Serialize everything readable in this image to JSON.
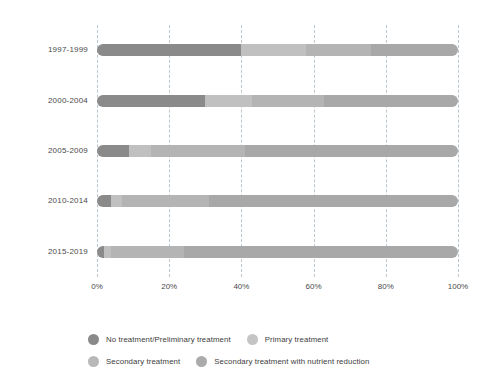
{
  "chart_data": {
    "type": "bar",
    "orientation": "horizontal",
    "stacked": true,
    "normalized": true,
    "title": "",
    "subtitle": "",
    "xlabel": "",
    "ylabel": "",
    "xlim": [
      0,
      100
    ],
    "grid": true,
    "legend_position": "bottom",
    "xtick_labels": [
      "0%",
      "20%",
      "40%",
      "60%",
      "80%",
      "100%"
    ],
    "xtick_values": [
      0,
      20,
      40,
      60,
      80,
      100
    ],
    "categories": [
      "1997-1999",
      "2000-2004",
      "2005-2009",
      "2010-2014",
      "2015-2019"
    ],
    "series": [
      {
        "name": "No treatment/Preliminary treatment",
        "color": "#8a8a8a",
        "values": [
          40,
          30,
          9,
          4,
          2
        ]
      },
      {
        "name": "Primary treatment",
        "color": "#c0c0c0",
        "values": [
          18,
          13,
          6,
          3,
          2
        ]
      },
      {
        "name": "Secondary treatment",
        "color": "#b4b4b4",
        "values": [
          18,
          20,
          26,
          24,
          20
        ]
      },
      {
        "name": "Secondary treatment with nutrient reduction",
        "color": "#a8a8a8",
        "values": [
          24,
          37,
          59,
          69,
          76
        ]
      }
    ]
  },
  "legend": {
    "items": [
      {
        "label": "No treatment/Preliminary treatment",
        "color": "#8a8a8a"
      },
      {
        "label": "Primary treatment",
        "color": "#c4c4c4"
      },
      {
        "label": "Secondary treatment",
        "color": "#b8b8b8"
      },
      {
        "label": "Secondary treatment with nutrient reduction",
        "color": "#ababab"
      }
    ]
  },
  "axis": {
    "x_ticks": [
      "0%",
      "20%",
      "40%",
      "60%",
      "80%",
      "100%"
    ],
    "y_categories": [
      "1997-1999",
      "2000-2004",
      "2005-2009",
      "2010-2014",
      "2015-2019"
    ]
  },
  "colors": {
    "background": "#ffffff",
    "gridline": "#b9c6cf",
    "text": "#3d3d3d"
  }
}
